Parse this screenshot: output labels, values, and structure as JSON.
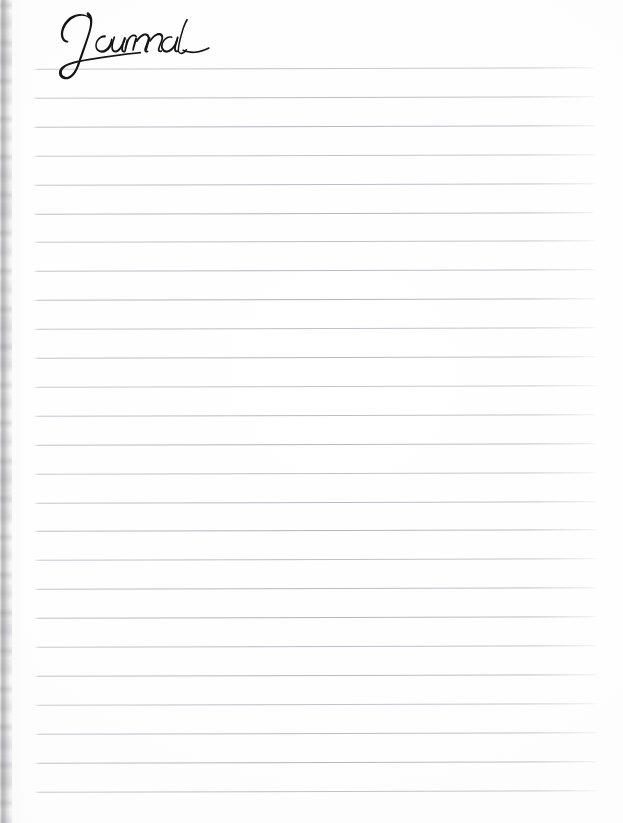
{
  "document": {
    "kind": "lined-journal-page",
    "title": "Journal",
    "title_style": "handwritten-script",
    "title_color": "#141414",
    "page_width": 623,
    "page_height": 823,
    "paper_color": "#fdfdfd",
    "body_text": ""
  },
  "ruling": {
    "line_color": "#b9b9c0",
    "line_count": 26,
    "first_line_y": 68,
    "line_spacing": 28.9,
    "line_left_x": 33,
    "line_right_x": 597,
    "line_thickness": 1,
    "tilt_degrees": -0.16,
    "lines_label": "ruled-writing-line"
  },
  "artifacts": {
    "left_edge_label": "scanner-shadow-strip",
    "left_edge_color": "#a6a6ac",
    "left_edge_width": 12,
    "right_margin_label": "blank-right-margin"
  },
  "a11y": {
    "page_description": "Blank lined journal page with handwritten Journal heading"
  }
}
